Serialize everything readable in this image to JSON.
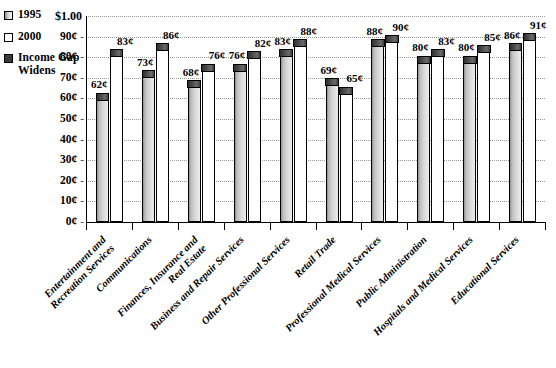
{
  "chart_data": {
    "type": "bar",
    "title": "",
    "subtitle": "",
    "xlabel": "",
    "ylabel": "",
    "ylim": [
      0,
      100
    ],
    "grid": true,
    "legend_position": "top-left",
    "value_unit": "¢",
    "top_axis_label": "$1.00",
    "ytick_labels": [
      "90¢",
      "80¢",
      "70¢",
      "60¢",
      "50¢",
      "40¢",
      "30¢",
      "20¢",
      "10¢",
      "0¢"
    ],
    "ytick_values": [
      90,
      80,
      70,
      60,
      50,
      40,
      30,
      20,
      10,
      0
    ],
    "categories": [
      "Entertainment and Recreation Services",
      "Communications",
      "Finances, Insurance and Real Estate",
      "Business and Repair Services",
      "Other Professional Services",
      "Retail Trade",
      "Professional Medical Services",
      "Public Administration",
      "Hospitals and Medical Services",
      "Educational Services"
    ],
    "categories_lines": [
      [
        "Entertainment and",
        "Recreation Services"
      ],
      [
        "Communications"
      ],
      [
        "Finances, Insurance and",
        "Real Estate"
      ],
      [
        "Business and Repair Services"
      ],
      [
        "Other Professional Services"
      ],
      [
        "Retail Trade"
      ],
      [
        "Professional Medical Services"
      ],
      [
        "Public Administration"
      ],
      [
        "Hospitals and Medical Services"
      ],
      [
        "Educational Services"
      ]
    ],
    "series": [
      {
        "name": "1995",
        "color": "#c9c9c9",
        "values": [
          62,
          73,
          68,
          76,
          83,
          69,
          88,
          80,
          80,
          86
        ]
      },
      {
        "name": "2000",
        "color": "#ffffff",
        "values": [
          83,
          86,
          76,
          82,
          88,
          65,
          90,
          83,
          85,
          91
        ]
      }
    ],
    "gap_marker": {
      "name": "Income Gap Widens",
      "color": "#3a3a3a"
    },
    "bar_labels_1995": [
      "62¢",
      "73¢",
      "68¢",
      "76¢",
      "83¢",
      "69¢",
      "88¢",
      "80¢",
      "80¢",
      "86¢"
    ],
    "bar_labels_2000": [
      "83¢",
      "86¢",
      "76¢",
      "82¢",
      "88¢",
      "65¢",
      "90¢",
      "83¢",
      "85¢",
      "91¢"
    ]
  },
  "legend": {
    "items": [
      {
        "label": "1995",
        "swatch": "sw-1995"
      },
      {
        "label": "2000",
        "swatch": "sw-2000"
      },
      {
        "label": "Income",
        "swatch": "sw-gap"
      }
    ],
    "gap_line2": "Gap",
    "gap_line3": "Widens"
  }
}
